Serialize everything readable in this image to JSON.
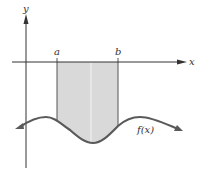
{
  "diagram": {
    "labels": {
      "y_axis": "y",
      "x_axis": "x",
      "a": "a",
      "b": "b",
      "function": "f(x)"
    },
    "colors": {
      "axis": "#333333",
      "curve": "#5a5a5a",
      "fill": "#d9d9d9",
      "fill_edge": "#555555",
      "divider": "#f2f2f2"
    }
  }
}
